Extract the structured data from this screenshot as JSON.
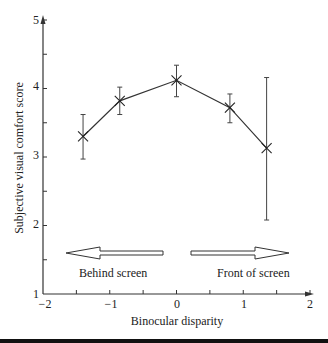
{
  "chart_data": {
    "type": "line",
    "title": "",
    "xlabel": "Binocular disparity",
    "ylabel": "Subjective visual comfort score",
    "xlim": [
      -2,
      2
    ],
    "ylim": [
      1,
      5
    ],
    "x_ticks": [
      -2,
      -1.5,
      -1,
      -0.5,
      0,
      0.5,
      1,
      1.5,
      2
    ],
    "x_tick_labels": [
      "−2",
      "−1",
      "0",
      "1",
      "2"
    ],
    "y_ticks": [
      1,
      1.5,
      2,
      2.5,
      3,
      3.5,
      4,
      4.5,
      5
    ],
    "y_tick_labels": [
      "1",
      "2",
      "3",
      "4",
      "5"
    ],
    "grid": false,
    "marker": "x",
    "series": [
      {
        "name": "Visual comfort",
        "x": [
          -1.4,
          -0.85,
          0,
          0.8,
          1.35
        ],
        "values": [
          3.3,
          3.82,
          4.12,
          3.72,
          3.13
        ],
        "error_low": [
          2.97,
          3.62,
          3.88,
          3.5,
          2.08
        ],
        "error_high": [
          3.62,
          4.02,
          4.34,
          3.92,
          4.16
        ]
      }
    ],
    "annotations": [
      {
        "text": "Behind screen",
        "arrow": "left",
        "x_range": [
          -1.65,
          -0.2
        ],
        "y": 1.62
      },
      {
        "text": "Front of screen",
        "arrow": "right",
        "x_range": [
          0.2,
          1.65
        ],
        "y": 1.62
      }
    ]
  },
  "labels": {
    "xlabel": "Binocular disparity",
    "ylabel": "Subjective visual comfort score",
    "behind": "Behind screen",
    "front": "Front of screen",
    "xt": [
      "−2",
      "−1",
      "0",
      "1",
      "2"
    ],
    "yt": [
      "1",
      "2",
      "3",
      "4",
      "5"
    ]
  },
  "colors": {
    "line": "#333333",
    "axis": "#333333",
    "text": "#222222"
  }
}
